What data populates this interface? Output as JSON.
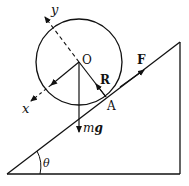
{
  "diagram": {
    "labels": {
      "y_axis": "y",
      "x_axis": "x",
      "center": "O",
      "reaction": "R",
      "friction": "F",
      "contact": "A",
      "weight_m": "m",
      "weight_g": "g",
      "angle": "θ"
    },
    "colors": {
      "stroke": "#111111",
      "background": "#ffffff"
    }
  }
}
